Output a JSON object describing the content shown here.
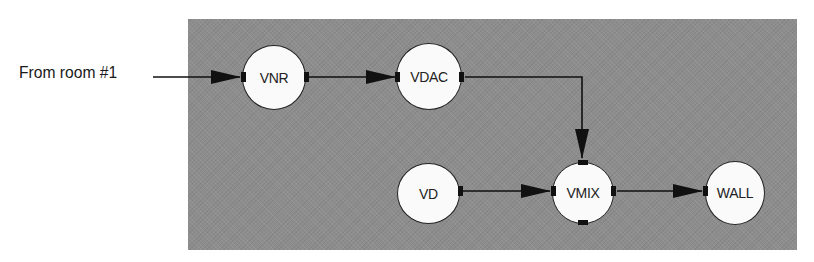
{
  "diagram": {
    "type": "signal-flow",
    "panel_color": "#8d8d8d",
    "node_fill": "#fafafa",
    "line_color": "#111111",
    "external_input": {
      "label": "From room #1",
      "target": "VNR"
    },
    "nodes": [
      {
        "id": "VNR",
        "label": "VNR",
        "cx": 274,
        "cy": 77,
        "r": 32
      },
      {
        "id": "VDAC",
        "label": "VDAC",
        "cx": 429,
        "cy": 77,
        "r": 33
      },
      {
        "id": "VD",
        "label": "VD",
        "cx": 428,
        "cy": 193,
        "r": 31
      },
      {
        "id": "VMIX",
        "label": "VMIX",
        "cx": 583,
        "cy": 193,
        "r": 31
      },
      {
        "id": "WALL",
        "label": "WALL",
        "cx": 735,
        "cy": 193,
        "r": 31
      }
    ],
    "edges": [
      {
        "from": "From room #1",
        "to": "VNR"
      },
      {
        "from": "VNR",
        "to": "VDAC"
      },
      {
        "from": "VDAC",
        "to": "VMIX",
        "route": "right-then-down"
      },
      {
        "from": "VD",
        "to": "VMIX"
      },
      {
        "from": "VMIX",
        "to": "WALL"
      }
    ]
  }
}
